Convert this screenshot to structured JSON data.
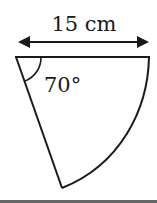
{
  "diagram": {
    "type": "sector",
    "dimension_label": "15 cm",
    "angle_label": "70°",
    "colors": {
      "stroke": "#1a1a1a",
      "background": "#ffffff",
      "bottom_rule": "#666666"
    }
  }
}
